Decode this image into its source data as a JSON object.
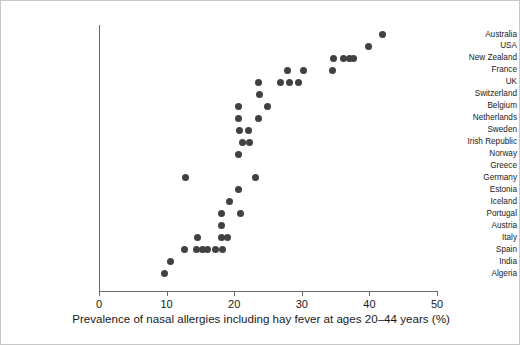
{
  "chart_data": {
    "type": "scatter",
    "title": "",
    "xlabel": "Prevalence of nasal allergies including hay fever at ages 20–44 years (%)",
    "ylabel": "",
    "xlim": [
      0,
      50
    ],
    "xticks": [
      0,
      10,
      20,
      30,
      40,
      50
    ],
    "xtick_labels": [
      "0",
      "10",
      "20",
      "30",
      "40",
      "50"
    ],
    "grid": false,
    "legend": null,
    "orientation": "horizontal-dotplot",
    "categories": [
      "Australia",
      "USA",
      "New Zealand",
      "France",
      "UK",
      "Switzerland",
      "Belgium",
      "Netherlands",
      "Sweden",
      "Irish Republic",
      "Norway",
      "Greece",
      "Germany",
      "Estonia",
      "Iceland",
      "Portugal",
      "Austria",
      "Italy",
      "Spain",
      "India",
      "Algeria"
    ],
    "points": [
      {
        "category": "Australia",
        "values": [
          41.9
        ]
      },
      {
        "category": "USA",
        "values": [
          39.8
        ]
      },
      {
        "category": "New Zealand",
        "values": [
          34.7,
          36.2,
          37.1,
          37.6
        ]
      },
      {
        "category": "France",
        "values": [
          27.9,
          30.3,
          34.6
        ]
      },
      {
        "category": "UK",
        "values": [
          23.6,
          26.9,
          28.2,
          29.5
        ]
      },
      {
        "category": "Switzerland",
        "values": [
          23.7
        ]
      },
      {
        "category": "Belgium",
        "values": [
          20.6,
          24.9
        ]
      },
      {
        "category": "Netherlands",
        "values": [
          20.6,
          23.6
        ]
      },
      {
        "category": "Sweden",
        "values": [
          20.8,
          22.1
        ]
      },
      {
        "category": "Irish Republic",
        "values": [
          21.2,
          22.3
        ]
      },
      {
        "category": "Norway",
        "values": [
          20.6
        ]
      },
      {
        "category": "Greece",
        "values": []
      },
      {
        "category": "Germany",
        "values": [
          12.8,
          23.2
        ]
      },
      {
        "category": "Estonia",
        "values": [
          20.6
        ]
      },
      {
        "category": "Iceland",
        "values": [
          19.3
        ]
      },
      {
        "category": "Portugal",
        "values": [
          18.1,
          20.9
        ]
      },
      {
        "category": "Austria",
        "values": [
          18.1
        ]
      },
      {
        "category": "Italy",
        "values": [
          14.6,
          18.1,
          19.0
        ]
      },
      {
        "category": "Spain",
        "values": [
          12.6,
          14.4,
          15.3,
          16.0,
          17.2,
          18.3
        ]
      },
      {
        "category": "India",
        "values": [
          10.6
        ]
      },
      {
        "category": "Algeria",
        "values": [
          9.7
        ]
      }
    ],
    "marker_color": "#414141",
    "axis_color": "#6b6b6b"
  },
  "figure": {
    "x_axis_title": "Prevalence of nasal allergies including hay fever at ages 20–44 years (%)"
  }
}
